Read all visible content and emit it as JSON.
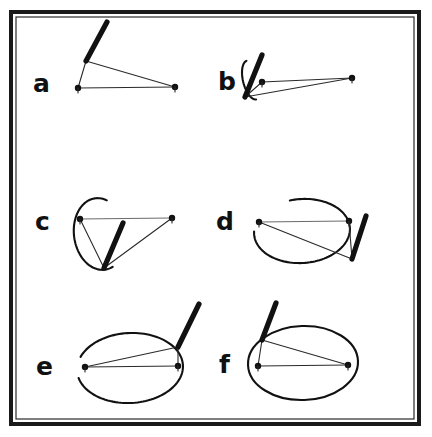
{
  "figure": {
    "background_color": "#ffffff",
    "ink_color": "#111111",
    "frame": {
      "x": 9,
      "y": 10,
      "width": 412,
      "height": 416,
      "stroke_color": "#1a1a1a",
      "stroke_width": 4
    },
    "panel_labels": [
      "a",
      "b",
      "c",
      "d",
      "e",
      "f"
    ]
  },
  "chart_data": {
    "type": "diagram",
    "panels": [
      {
        "id": "a",
        "label": "a",
        "label_x": 33,
        "label_y": 92,
        "arc": {
          "present": false,
          "sweep_description": "no arc"
        },
        "nodes": [
          {
            "name": "left-node",
            "x": 78,
            "y": 88
          },
          {
            "name": "right-node",
            "x": 175,
            "y": 87
          }
        ],
        "apex": {
          "x": 86,
          "y": 61
        },
        "bar": {
          "x1": 86,
          "y1": 61,
          "x2": 107,
          "y2": 22,
          "description": "thick bar rising steeply up-right from apex"
        },
        "thin_segments": [
          {
            "x1": 78,
            "y1": 88,
            "x2": 175,
            "y2": 87
          },
          {
            "x1": 78,
            "y1": 88,
            "x2": 86,
            "y2": 61
          },
          {
            "x1": 86,
            "y1": 61,
            "x2": 175,
            "y2": 87
          }
        ]
      },
      {
        "id": "b",
        "label": "b",
        "label_x": 218,
        "label_y": 90,
        "arc": {
          "present": true,
          "cx": 252,
          "cy": 80,
          "rx": 9,
          "ry": 20,
          "rotation": -14,
          "start_deg": 95,
          "end_deg": 265,
          "sweep_description": "very narrow sliver arc, leftmost edge only"
        },
        "nodes": [
          {
            "name": "left-node",
            "x": 262,
            "y": 82
          },
          {
            "name": "right-node",
            "x": 352,
            "y": 78
          }
        ],
        "apex": {
          "x": 245,
          "y": 97
        },
        "bar": {
          "x1": 245,
          "y1": 97,
          "x2": 262,
          "y2": 55,
          "description": "thick near-vertical bar from bottom apex"
        },
        "thin_segments": [
          {
            "x1": 262,
            "y1": 82,
            "x2": 352,
            "y2": 78
          },
          {
            "x1": 245,
            "y1": 97,
            "x2": 262,
            "y2": 82
          },
          {
            "x1": 245,
            "y1": 97,
            "x2": 352,
            "y2": 78
          }
        ]
      },
      {
        "id": "c",
        "label": "c",
        "label_x": 35,
        "label_y": 230,
        "arc": {
          "present": true,
          "cx": 100,
          "cy": 234,
          "rx": 26,
          "ry": 36,
          "rotation": -8,
          "start_deg": 72,
          "end_deg": 296,
          "sweep_description": "roughly half arc opening to the right"
        },
        "nodes": [
          {
            "name": "left-node",
            "x": 80,
            "y": 219
          },
          {
            "name": "right-node",
            "x": 172,
            "y": 218
          }
        ],
        "apex": {
          "x": 104,
          "y": 268
        },
        "bar": {
          "x1": 104,
          "y1": 268,
          "x2": 123,
          "y2": 223,
          "description": "thick bar from bottom apex up-right"
        },
        "thin_segments": [
          {
            "x1": 80,
            "y1": 219,
            "x2": 172,
            "y2": 218
          },
          {
            "x1": 80,
            "y1": 219,
            "x2": 104,
            "y2": 268
          },
          {
            "x1": 104,
            "y1": 268,
            "x2": 172,
            "y2": 218
          }
        ]
      },
      {
        "id": "d",
        "label": "d",
        "label_x": 216,
        "label_y": 230,
        "arc": {
          "present": true,
          "cx": 302,
          "cy": 231,
          "rx": 48,
          "ry": 32,
          "rotation": -4,
          "start_deg": 258,
          "end_deg": 545,
          "sweep_description": "about three-quarters of an ellipse, gap at upper right"
        },
        "nodes": [
          {
            "name": "left-node",
            "x": 259,
            "y": 222
          },
          {
            "name": "right-node",
            "x": 349,
            "y": 221
          }
        ],
        "apex": {
          "x": 352,
          "y": 259
        },
        "bar": {
          "x1": 352,
          "y1": 259,
          "x2": 366,
          "y2": 216,
          "description": "thick bar from lower right vertex up-right"
        },
        "thin_segments": [
          {
            "x1": 259,
            "y1": 222,
            "x2": 349,
            "y2": 221
          },
          {
            "x1": 259,
            "y1": 222,
            "x2": 352,
            "y2": 259
          },
          {
            "x1": 349,
            "y1": 221,
            "x2": 352,
            "y2": 259
          }
        ]
      },
      {
        "id": "e",
        "label": "e",
        "label_x": 36,
        "label_y": 375,
        "arc": {
          "present": true,
          "cx": 130,
          "cy": 368,
          "rx": 53,
          "ry": 35,
          "rotation": -3,
          "start_deg": 203,
          "end_deg": 528,
          "sweep_description": "nearly complete ellipse with a small gap at upper left"
        },
        "nodes": [
          {
            "name": "left-node",
            "x": 85,
            "y": 367
          },
          {
            "name": "right-node",
            "x": 178,
            "y": 366
          }
        ],
        "apex": {
          "x": 178,
          "y": 347
        },
        "bar": {
          "x1": 178,
          "y1": 347,
          "x2": 199,
          "y2": 304,
          "description": "thick bar from upper right vertex up-right"
        },
        "thin_segments": [
          {
            "x1": 85,
            "y1": 367,
            "x2": 178,
            "y2": 366
          },
          {
            "x1": 85,
            "y1": 367,
            "x2": 178,
            "y2": 347
          },
          {
            "x1": 178,
            "y1": 347,
            "x2": 178,
            "y2": 366
          }
        ]
      },
      {
        "id": "f",
        "label": "f",
        "label_x": 219,
        "label_y": 373,
        "arc": {
          "present": true,
          "cx": 303,
          "cy": 363,
          "rx": 55,
          "ry": 37,
          "rotation": -2,
          "start_deg": 0,
          "end_deg": 360,
          "sweep_description": "complete closed ellipse"
        },
        "nodes": [
          {
            "name": "left-node",
            "x": 258,
            "y": 366
          },
          {
            "name": "right-node",
            "x": 348,
            "y": 365
          }
        ],
        "apex": {
          "x": 262,
          "y": 340
        },
        "bar": {
          "x1": 262,
          "y1": 340,
          "x2": 276,
          "y2": 303,
          "description": "thick bar from upper left vertex up-right"
        },
        "thin_segments": [
          {
            "x1": 258,
            "y1": 366,
            "x2": 348,
            "y2": 365
          },
          {
            "x1": 258,
            "y1": 366,
            "x2": 262,
            "y2": 340
          },
          {
            "x1": 262,
            "y1": 340,
            "x2": 348,
            "y2": 365
          }
        ]
      }
    ]
  }
}
